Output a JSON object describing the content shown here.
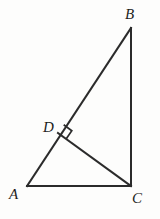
{
  "figure": {
    "kind": "geometry-diagram",
    "background_color": "#fdfdfc",
    "stroke_color": "#2b2b2b",
    "stroke_width": 2,
    "canvas": {
      "width": 160,
      "height": 219
    },
    "labels": {
      "A": "A",
      "B": "B",
      "C": "C",
      "D": "D"
    },
    "points": {
      "A": {
        "x": 27,
        "y": 186
      },
      "B": {
        "x": 131,
        "y": 28
      },
      "C": {
        "x": 131,
        "y": 186
      },
      "D": {
        "x": 58,
        "y": 133
      }
    },
    "segments": [
      {
        "name": "AB",
        "from": "A",
        "to": "B"
      },
      {
        "name": "BC",
        "from": "B",
        "to": "C"
      },
      {
        "name": "AC",
        "from": "A",
        "to": "C"
      },
      {
        "name": "DC",
        "from": "D",
        "to": "C"
      }
    ],
    "right_angle_marks": [
      {
        "at": "D",
        "between": [
          "A",
          "C"
        ],
        "size": 10
      }
    ]
  }
}
